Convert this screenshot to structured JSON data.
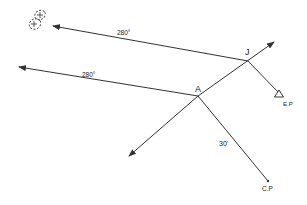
{
  "diagram": {
    "colors": {
      "line": "#333333",
      "text": "#222222",
      "background": "#ffffff"
    },
    "points": {
      "J": {
        "label": "J",
        "x": 248,
        "y": 61
      },
      "A": {
        "label": "A",
        "x": 198,
        "y": 96
      },
      "EP": {
        "label": "E.P",
        "x": 279,
        "y": 95
      },
      "CP": {
        "label": "C.P",
        "x": 269,
        "y": 181
      }
    },
    "bearings": {
      "upper": {
        "label": "280°"
      },
      "lower": {
        "label": "280°"
      },
      "cp": {
        "label": "30'"
      }
    },
    "icons": {
      "ep_marker": "triangle-icon",
      "target_cluster": "dashed-ellipse-cross-icon"
    }
  }
}
